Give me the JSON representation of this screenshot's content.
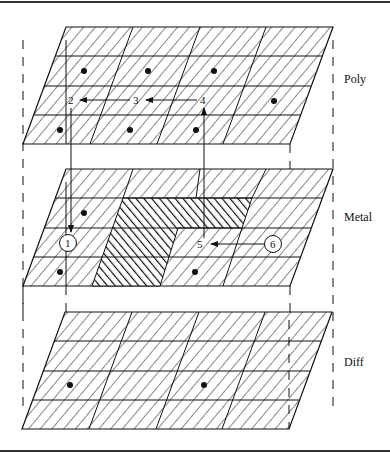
{
  "figure": {
    "border_color": "#333333",
    "line_color": "#111111",
    "layers": [
      {
        "name": "Poly",
        "label": "Poly",
        "top_y": 27,
        "bottom_y": 144,
        "top_x": [
          66,
          333
        ],
        "bottom_x": [
          23,
          290
        ],
        "label_pos": [
          344,
          83
        ],
        "dots": [
          [
            84,
            71
          ],
          [
            148,
            71
          ],
          [
            214,
            71
          ],
          [
            274,
            101
          ],
          [
            60,
            130
          ],
          [
            130,
            130
          ],
          [
            196,
            130
          ]
        ]
      },
      {
        "name": "Metal",
        "label": "Metal",
        "top_y": 169,
        "bottom_y": 286,
        "top_x": [
          66,
          333
        ],
        "bottom_x": [
          23,
          290
        ],
        "label_pos": [
          344,
          221
        ],
        "dots": [
          [
            84,
            213
          ],
          [
            60,
            272
          ],
          [
            195,
            272
          ]
        ]
      },
      {
        "name": "Diff",
        "label": "Diff",
        "top_y": 312,
        "bottom_y": 429,
        "top_x": [
          65,
          332
        ],
        "bottom_x": [
          22,
          289
        ],
        "label_pos": [
          344,
          366
        ],
        "dots": [
          [
            70,
            385
          ],
          [
            204,
            385
          ]
        ]
      }
    ],
    "path_points": {
      "p1": {
        "label": "1",
        "x": 68,
        "y": 243,
        "circled": true
      },
      "p2": {
        "label": "2",
        "x": 72,
        "y": 104,
        "circled": false
      },
      "p3": {
        "label": "3",
        "x": 137,
        "y": 104,
        "circled": false
      },
      "p4": {
        "label": "4",
        "x": 204,
        "y": 104,
        "circled": false
      },
      "p5": {
        "label": "5",
        "x": 201,
        "y": 248,
        "circled": false
      },
      "p6": {
        "label": "6",
        "x": 273,
        "y": 244,
        "circled": true
      }
    },
    "arrows": [
      {
        "from": "3",
        "to": "2"
      },
      {
        "from": "4",
        "to": "3"
      },
      {
        "from": "5",
        "to": "4"
      },
      {
        "from": "2",
        "to": "1"
      },
      {
        "from": "6",
        "to": "5"
      }
    ]
  }
}
